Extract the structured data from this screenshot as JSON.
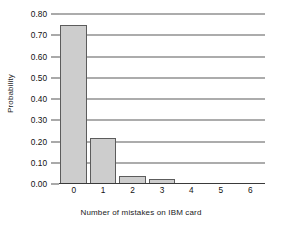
{
  "chart_data": {
    "type": "bar",
    "title": "",
    "subtitle": "",
    "xlabel": "Number of mistakes on IBM card",
    "ylabel": "Probability",
    "categories": [
      "0",
      "1",
      "2",
      "3",
      "4",
      "5",
      "6"
    ],
    "values": [
      0.75,
      0.215,
      0.04,
      0.022,
      0.0,
      0.0,
      0.0
    ],
    "series": [
      {
        "name": "Probability",
        "values": [
          0.75,
          0.215,
          0.04,
          0.022,
          0.0,
          0.0,
          0.0
        ]
      }
    ],
    "xlim": [
      -0.5,
      6.5
    ],
    "ylim": [
      0.0,
      0.8
    ],
    "y_ticks": [
      0.0,
      0.1,
      0.2,
      0.3,
      0.4,
      0.5,
      0.6,
      0.7,
      0.8
    ],
    "y_tick_labels": [
      "0.00",
      "0.10",
      "0.20",
      "0.30",
      "0.40",
      "0.50",
      "0.60",
      "0.70",
      "0.80"
    ],
    "x_ticks": [
      0,
      1,
      2,
      3,
      4,
      5,
      6
    ],
    "x_tick_labels": [
      "0",
      "1",
      "2",
      "3",
      "4",
      "5",
      "6"
    ],
    "grid": true,
    "grid_axis": "y",
    "legend": false,
    "legend_position": "none",
    "bar_fill_color": "#cdcdcd",
    "bar_edge_color": "#5c5c5c",
    "gridline_color": "#5a5a5a",
    "axis_color": "#3a3a3a",
    "background_color": "#ffffff",
    "annotations": []
  }
}
